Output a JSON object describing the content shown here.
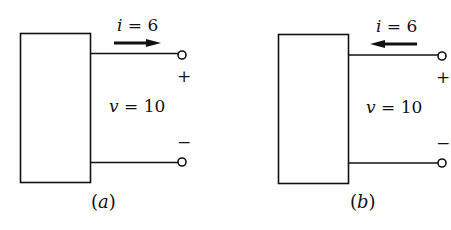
{
  "colors": {
    "background": "#ffffff",
    "ink": "#111111"
  },
  "panels": [
    {
      "id": "a",
      "caption": "(a)",
      "caption_letter": "a",
      "current_label": "i = 6",
      "current_var": "i",
      "current_value": "6",
      "current_direction": "right",
      "voltage_label": "v = 10",
      "voltage_var": "v",
      "voltage_value": "10",
      "plus_sign": "+",
      "minus_sign": "−"
    },
    {
      "id": "b",
      "caption": "(b)",
      "caption_letter": "b",
      "current_label": "i = 6",
      "current_var": "i",
      "current_value": "6",
      "current_direction": "left",
      "voltage_label": "v = 10",
      "voltage_var": "v",
      "voltage_value": "10",
      "plus_sign": "+",
      "minus_sign": "−"
    }
  ]
}
